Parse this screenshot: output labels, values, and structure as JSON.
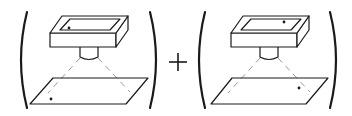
{
  "figure": {
    "operator": "+",
    "colors": {
      "stroke": "#1a1a1a",
      "beam": "#9a9a9a",
      "background": "#ffffff"
    },
    "panels": [
      {
        "id": "left",
        "box_dot_position": "front-left",
        "plane_dot_position": "front-left"
      },
      {
        "id": "right",
        "box_dot_position": "back-right",
        "plane_dot_position": "right"
      }
    ]
  }
}
